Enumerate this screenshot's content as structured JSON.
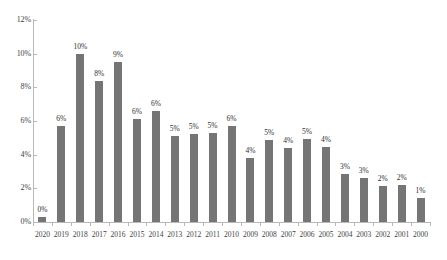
{
  "chart_data": {
    "type": "bar",
    "title": "",
    "subtitle": "",
    "xlabel": "",
    "ylabel": "",
    "categories": [
      "2020",
      "2019",
      "2018",
      "2017",
      "2016",
      "2015",
      "2014",
      "2013",
      "2012",
      "2011",
      "2010",
      "2009",
      "2008",
      "2007",
      "2006",
      "2005",
      "2004",
      "2003",
      "2002",
      "2001",
      "2000"
    ],
    "values": [
      0.3,
      5.7,
      10.0,
      8.4,
      9.5,
      6.1,
      6.6,
      5.1,
      5.25,
      5.3,
      5.7,
      3.8,
      4.85,
      4.4,
      4.95,
      4.45,
      2.85,
      2.6,
      2.15,
      2.2,
      1.4
    ],
    "data_labels": [
      "0%",
      "6%",
      "10%",
      "8%",
      "9%",
      "6%",
      "6%",
      "5%",
      "5%",
      "5%",
      "6%",
      "4%",
      "5%",
      "4%",
      "5%",
      "4%",
      "3%",
      "3%",
      "2%",
      "2%",
      "1%"
    ],
    "ylim": [
      0,
      12
    ],
    "ytick_values": [
      0,
      2,
      4,
      6,
      8,
      10,
      12
    ],
    "ytick_labels": [
      "0%",
      "2%",
      "4%",
      "6%",
      "8%",
      "10%",
      "12%"
    ],
    "grid": false,
    "legend": null,
    "series_color": "#757575",
    "axis_color": "#b9b9b9",
    "background_color": "#ffffff"
  }
}
